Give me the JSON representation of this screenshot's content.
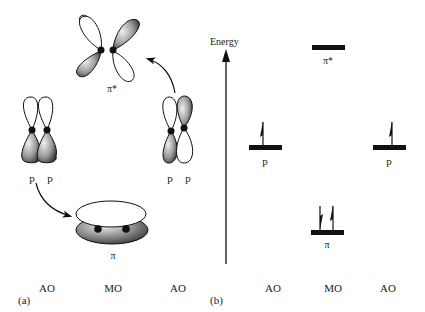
{
  "figure": {
    "panel_a": {
      "caption": "(a)",
      "orbitals": {
        "pi_star": {
          "label": "π*"
        },
        "left_pair": {
          "labels": [
            "p",
            "p"
          ]
        },
        "right_pair": {
          "labels": [
            "p",
            "p"
          ]
        },
        "pi": {
          "label": "π"
        }
      },
      "columns": [
        "AO",
        "MO",
        "AO"
      ]
    },
    "panel_b": {
      "caption": "(b)",
      "axis_label": "Energy",
      "levels": [
        {
          "id": "pi_star",
          "label": "π*",
          "electrons": 0
        },
        {
          "id": "p_left",
          "label": "p",
          "electrons": 1
        },
        {
          "id": "p_right",
          "label": "p",
          "electrons": 1
        },
        {
          "id": "pi",
          "label": "π",
          "electrons": 2
        }
      ],
      "columns": [
        "AO",
        "MO",
        "AO"
      ]
    },
    "colors": {
      "ink": "#111111",
      "lobe_shade_dark": "#555555",
      "lobe_shade_light": "#e8e8e8"
    }
  }
}
